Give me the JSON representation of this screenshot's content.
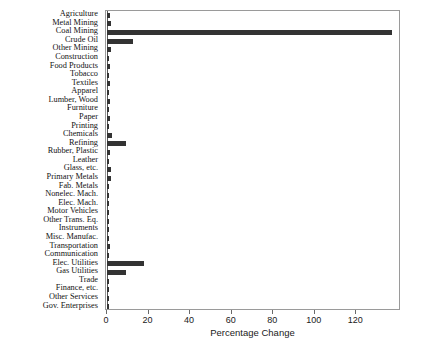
{
  "chart_data": {
    "type": "bar",
    "orientation": "horizontal",
    "title": "",
    "xlabel": "Percentage Change",
    "ylabel": "",
    "xlim": [
      0,
      141
    ],
    "xticks": [
      0,
      20,
      40,
      60,
      80,
      100,
      120
    ],
    "xtick_labels": [
      "0",
      "20",
      "40",
      "60",
      "80",
      "100",
      "120"
    ],
    "grid": false,
    "legend": null,
    "bar_color": "#333333",
    "frame_color": "#9a9a9a",
    "categories": [
      "Agriculture",
      "Metal Mining",
      "Coal Mining",
      "Crude Oil",
      "Other Mining",
      "Construction",
      "Food Products",
      "Tobacco",
      "Textiles",
      "Apparel",
      "Lumber, Wood",
      "Furniture",
      "Paper",
      "Printing",
      "Chemicals",
      "Refining",
      "Rubber, Plastic",
      "Leather",
      "Glass, etc.",
      "Primary Metals",
      "Fab. Metals",
      "Nonelec. Mach.",
      "Elec. Mach.",
      "Motor Vehicles",
      "Other Trans. Eq.",
      "Instruments",
      "Misc. Manufac.",
      "Transportation",
      "Communication",
      "Elec. Utilities",
      "Gas Utilities",
      "Trade",
      "Finance, etc.",
      "Other Services",
      "Gov. Enterprises"
    ],
    "values": [
      1.6,
      2.0,
      137.0,
      12.5,
      2.0,
      1.0,
      1.3,
      0.9,
      1.4,
      0.9,
      1.4,
      1.1,
      1.6,
      1.0,
      2.4,
      9.3,
      1.5,
      0.8,
      1.8,
      1.9,
      1.1,
      1.0,
      1.0,
      1.0,
      0.9,
      0.9,
      1.0,
      1.6,
      1.0,
      18.0,
      9.0,
      0.9,
      0.8,
      0.8,
      1.2
    ]
  }
}
